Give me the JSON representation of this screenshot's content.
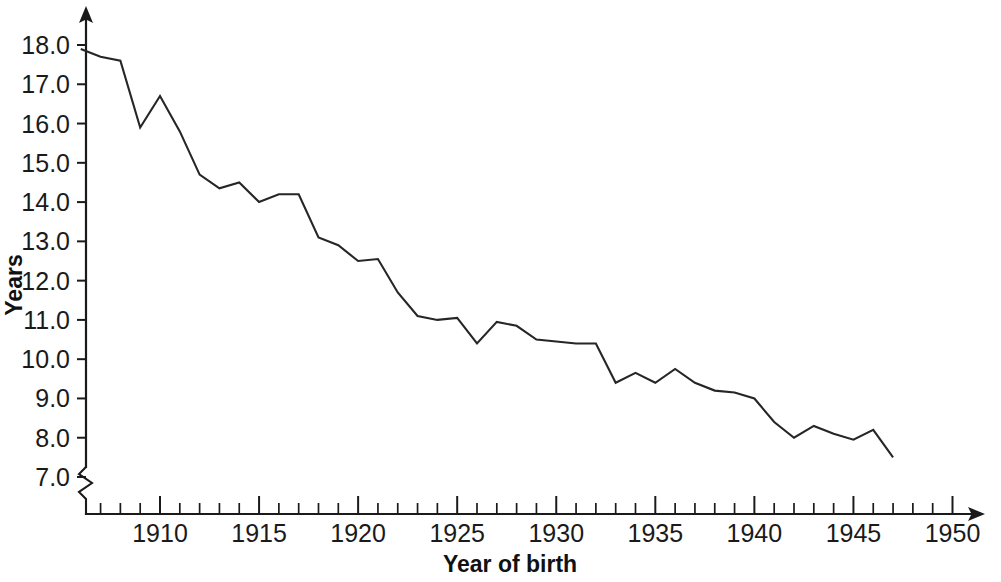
{
  "chart_data": {
    "type": "line",
    "title": "",
    "xlabel": "Year of birth",
    "ylabel": "Years",
    "xlim": [
      1906,
      1952
    ],
    "ylim": [
      6.6,
      18.4
    ],
    "grid": false,
    "legend": "none",
    "axis_break": "y-axis broken below 7.0",
    "x_tick_labels": [
      "1910",
      "1915",
      "1920",
      "1925",
      "1930",
      "1935",
      "1940",
      "1945",
      "1950"
    ],
    "x_major_ticks": [
      1910,
      1915,
      1920,
      1925,
      1930,
      1935,
      1940,
      1945,
      1950
    ],
    "x_minor_tick_interval": 1,
    "y_tick_labels": [
      "7.0",
      "8.0",
      "9.0",
      "10.0",
      "11.0",
      "12.0",
      "13.0",
      "14.0",
      "15.0",
      "16.0",
      "17.0",
      "18.0"
    ],
    "y_major_ticks": [
      7.0,
      8.0,
      9.0,
      10.0,
      11.0,
      12.0,
      13.0,
      14.0,
      15.0,
      16.0,
      17.0,
      18.0
    ],
    "series": [
      {
        "name": "Years of schooling",
        "color": "#262626",
        "x": [
          1906,
          1907,
          1908,
          1909,
          1910,
          1911,
          1912,
          1913,
          1914,
          1915,
          1916,
          1917,
          1918,
          1919,
          1920,
          1921,
          1922,
          1923,
          1924,
          1925,
          1926,
          1927,
          1928,
          1929,
          1930,
          1931,
          1932,
          1933,
          1934,
          1935,
          1936,
          1937,
          1938,
          1939,
          1940,
          1941,
          1942,
          1943,
          1944,
          1945,
          1946,
          1947
        ],
        "values": [
          17.9,
          17.7,
          17.6,
          15.9,
          16.7,
          15.8,
          14.7,
          14.35,
          14.5,
          14.0,
          14.2,
          14.2,
          13.1,
          12.9,
          12.5,
          12.55,
          11.7,
          11.1,
          11.0,
          11.05,
          10.4,
          10.95,
          10.85,
          10.5,
          10.45,
          10.4,
          10.4,
          9.4,
          9.65,
          9.4,
          9.75,
          9.4,
          9.2,
          9.15,
          9.0,
          8.4,
          8.0,
          8.3,
          8.1,
          7.95,
          8.2,
          7.5
        ]
      }
    ]
  }
}
